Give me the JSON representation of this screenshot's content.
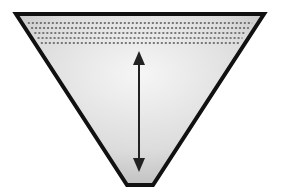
{
  "diagram": {
    "features": [
      "dotted liquid layers near top",
      "double-headed vertical depth arrow"
    ],
    "dotted_layer_count": 5,
    "colors": {
      "outline": "#111111",
      "fill_light": "#f4f4f4",
      "fill_dark": "#b9b9b9",
      "dots": "#555555",
      "arrow": "#222222"
    }
  }
}
